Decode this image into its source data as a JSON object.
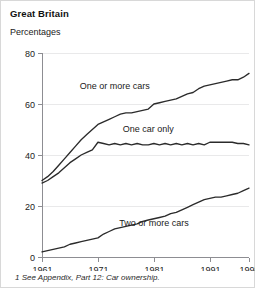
{
  "header": {
    "region_title": "Great Britain",
    "units_label": "Percentages"
  },
  "footnote": "1 See Appendix, Part 12: Car ownership.",
  "chart_data": {
    "type": "line",
    "title": "Great Britain",
    "subtitle": "Percentages",
    "xlabel": "",
    "ylabel": "Percentages",
    "xlim": [
      1961,
      1998
    ],
    "ylim": [
      0,
      80
    ],
    "grid": true,
    "legend_position": "inline-labels",
    "yticks": [
      0,
      20,
      40,
      60,
      80
    ],
    "ytick_labels": [
      "0",
      "20",
      "40",
      "60",
      "80"
    ],
    "xticks": [
      1961,
      1971,
      1981,
      1991,
      1998
    ],
    "xtick_labels": [
      "1961",
      "1971",
      "1981",
      "1991",
      "1998"
    ],
    "x": [
      1961,
      1962,
      1963,
      1964,
      1965,
      1966,
      1967,
      1968,
      1969,
      1970,
      1971,
      1972,
      1973,
      1974,
      1975,
      1976,
      1977,
      1978,
      1979,
      1980,
      1981,
      1982,
      1983,
      1984,
      1985,
      1986,
      1987,
      1988,
      1989,
      1990,
      1991,
      1992,
      1993,
      1994,
      1995,
      1996,
      1997,
      1998
    ],
    "series": [
      {
        "name": "One or more cars",
        "label": "One or more cars",
        "label_x": 1974,
        "label_y": 66,
        "values": [
          30,
          31.5,
          33.5,
          36,
          38.5,
          41,
          43.5,
          46,
          48,
          50,
          52,
          53,
          54,
          55,
          56,
          56.5,
          56.5,
          57,
          57.5,
          58,
          60,
          60.5,
          61,
          61.5,
          62,
          63,
          64,
          64.5,
          66,
          67,
          67.5,
          68,
          68.5,
          69,
          69.5,
          69.5,
          70.5,
          72
        ]
      },
      {
        "name": "One car only",
        "label": "One car only",
        "label_x": 1980,
        "label_y": 49,
        "values": [
          29,
          30,
          31.5,
          33,
          35,
          37,
          38.5,
          40,
          41,
          42,
          45,
          44.5,
          44,
          44.5,
          44,
          44.5,
          44,
          44.5,
          44,
          44,
          44.5,
          44,
          44.5,
          44,
          44.5,
          44,
          44.5,
          44,
          44.5,
          44,
          45,
          45,
          45,
          45,
          45,
          44.5,
          44.5,
          44
        ]
      },
      {
        "name": "Two or more cars",
        "label": "Two or more cars",
        "label_x": 1981,
        "label_y": 12,
        "values": [
          2,
          2.5,
          3,
          3.5,
          4,
          5,
          5.5,
          6,
          6.5,
          7,
          7.5,
          9,
          10,
          11,
          11.5,
          12,
          12.5,
          13,
          14,
          14.5,
          15,
          15.5,
          16,
          17,
          17.5,
          18.5,
          19.5,
          20.5,
          21.5,
          22.5,
          23,
          23.5,
          23.5,
          24,
          24.5,
          25,
          26,
          27
        ]
      }
    ]
  }
}
